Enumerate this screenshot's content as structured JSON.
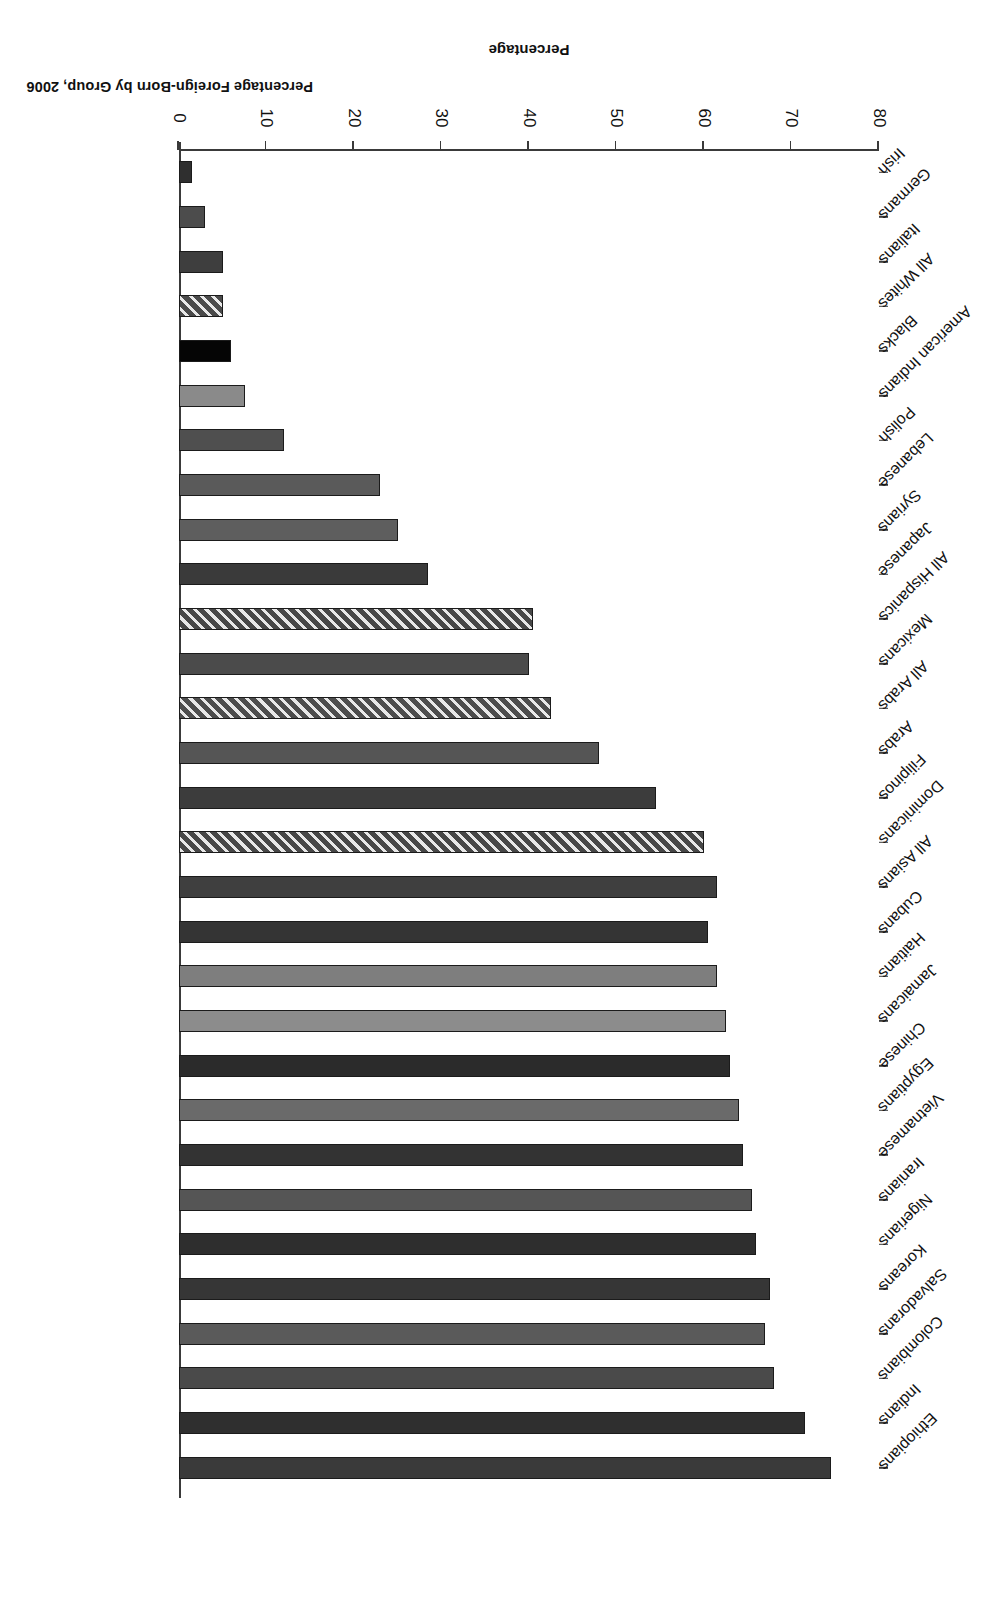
{
  "figure": {
    "title": "Percentage Foreign-Born by Group, 2006",
    "axis_title": "Percentage"
  },
  "chart_data": {
    "type": "bar",
    "orientation": "horizontal",
    "title": "Percentage Foreign-Born by Group, 2006",
    "xlabel": "Percentage",
    "ylabel": "",
    "ylim": [
      0,
      80
    ],
    "grid": false,
    "legend": "none",
    "tick_labels": [
      "0",
      "10",
      "20",
      "30",
      "40",
      "50",
      "60",
      "70",
      "80"
    ],
    "ticks": [
      0,
      10,
      20,
      30,
      40,
      50,
      60,
      70,
      80
    ],
    "categories": [
      "Ethiopians",
      "Indians",
      "Colombians",
      "Salvadorans",
      "Koreans",
      "Nigerians",
      "Iranians",
      "Vietnamese",
      "Egyptians",
      "Chinese",
      "Jamaicans",
      "Haitians",
      "Cubans",
      "All Asians",
      "Dominicans",
      "Filipinos",
      "Arabs",
      "All Arabs",
      "Mexicans",
      "All Hispanics",
      "Japanese",
      "Syrians",
      "Lebanese",
      "Polish",
      "American Indians",
      "Blacks",
      "All Whites",
      "Italians",
      "Germans",
      "Irish"
    ],
    "values": [
      74.5,
      71.5,
      68.0,
      67.0,
      67.5,
      66.0,
      65.5,
      64.5,
      64.0,
      63.0,
      62.5,
      61.5,
      60.5,
      61.5,
      60.0,
      54.5,
      48.0,
      42.5,
      40.0,
      40.5,
      28.5,
      25.0,
      23.0,
      12.0,
      7.5,
      6.0,
      5.0,
      5.0,
      3.0,
      1.5
    ],
    "bar_styles": [
      {
        "fill": "#3a3a3a",
        "pattern": "solid"
      },
      {
        "fill": "#2f2f2f",
        "pattern": "solid"
      },
      {
        "fill": "#4a4a4a",
        "pattern": "solid"
      },
      {
        "fill": "#5a5a5a",
        "pattern": "solid"
      },
      {
        "fill": "#363636",
        "pattern": "solid"
      },
      {
        "fill": "#2e2e2e",
        "pattern": "solid"
      },
      {
        "fill": "#555555",
        "pattern": "solid"
      },
      {
        "fill": "#333333",
        "pattern": "solid"
      },
      {
        "fill": "#6a6a6a",
        "pattern": "solid"
      },
      {
        "fill": "#2b2b2b",
        "pattern": "solid"
      },
      {
        "fill": "#8c8c8c",
        "pattern": "solid"
      },
      {
        "fill": "#7e7e7e",
        "pattern": "solid"
      },
      {
        "fill": "#343434",
        "pattern": "solid"
      },
      {
        "fill": "#3f3f3f",
        "pattern": "solid"
      },
      {
        "fill": "#474747",
        "pattern": "hatch"
      },
      {
        "fill": "#3c3c3c",
        "pattern": "solid"
      },
      {
        "fill": "#555555",
        "pattern": "solid"
      },
      {
        "fill": "#4d4d4d",
        "pattern": "hatch"
      },
      {
        "fill": "#4b4b4b",
        "pattern": "solid"
      },
      {
        "fill": "#474747",
        "pattern": "hatch"
      },
      {
        "fill": "#3a3a3a",
        "pattern": "solid"
      },
      {
        "fill": "#5e5e5e",
        "pattern": "solid"
      },
      {
        "fill": "#5a5a5a",
        "pattern": "solid"
      },
      {
        "fill": "#4f4f4f",
        "pattern": "solid"
      },
      {
        "fill": "#8a8a8a",
        "pattern": "solid"
      },
      {
        "fill": "#050505",
        "pattern": "solid"
      },
      {
        "fill": "#4a4a4a",
        "pattern": "hatch"
      },
      {
        "fill": "#3e3e3e",
        "pattern": "solid"
      },
      {
        "fill": "#4c4c4c",
        "pattern": "solid"
      },
      {
        "fill": "#2f2f2f",
        "pattern": "solid"
      }
    ]
  }
}
